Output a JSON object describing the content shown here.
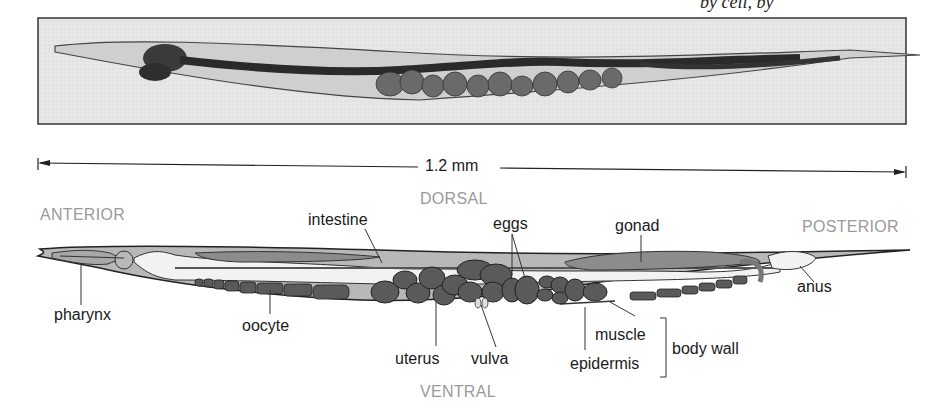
{
  "header_fragment": "by cell, by",
  "micrograph": {
    "alt": "light micrograph of adult C. elegans hermaphrodite"
  },
  "scale_bar": {
    "label": "1.2 mm"
  },
  "orientation": {
    "dorsal": "DORSAL",
    "ventral": "VENTRAL",
    "anterior": "ANTERIOR",
    "posterior": "POSTERIOR"
  },
  "labels": {
    "intestine": "intestine",
    "eggs": "eggs",
    "gonad": "gonad",
    "anus": "anus",
    "pharynx": "pharynx",
    "oocyte": "oocyte",
    "uterus": "uterus",
    "vulva": "vulva",
    "muscle": "muscle",
    "epidermis": "epidermis",
    "body_wall": "body wall"
  },
  "colors": {
    "body": "#b8b8b8",
    "organ_dark": "#5a5a5a",
    "gonad": "#8c8c8c",
    "lumen": "#f2f2f2",
    "outline": "#222222",
    "direction_text": "#9a9a9a"
  }
}
